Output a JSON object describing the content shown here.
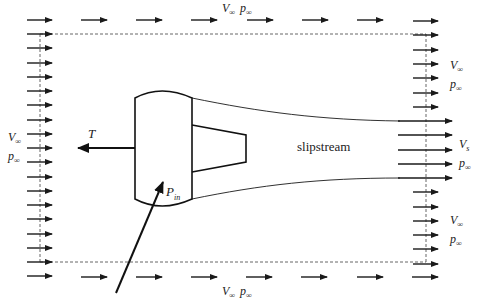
{
  "diagram": {
    "labels": {
      "top": {
        "v": "V",
        "v_sub": "∞",
        "p": "p",
        "p_sub": "∞"
      },
      "bottom": {
        "v": "V",
        "v_sub": "∞",
        "p": "p",
        "p_sub": "∞"
      },
      "left": {
        "v": "V",
        "v_sub": "∞",
        "p": "p",
        "p_sub": "∞"
      },
      "right_upper": {
        "v": "V",
        "v_sub": "∞",
        "p": "p",
        "p_sub": "∞"
      },
      "right_slip": {
        "v": "V",
        "v_sub": "s",
        "p": "p",
        "p_sub": "∞"
      },
      "right_lower": {
        "v": "V",
        "v_sub": "∞",
        "p": "p",
        "p_sub": "∞"
      },
      "thrust": "T",
      "power_in": {
        "p": "P",
        "p_sub": "in"
      },
      "slipstream": "slipstream"
    },
    "colors": {
      "ink": "#1a1a1a",
      "dash": "#666666",
      "background": "#ffffff"
    },
    "flow_arrows": {
      "left_column_count": 19,
      "top_row_count": 8,
      "bottom_row_count": 8,
      "right_freestream_upper_count": 7,
      "right_slipstream_count": 5,
      "right_freestream_lower_count": 7
    }
  }
}
